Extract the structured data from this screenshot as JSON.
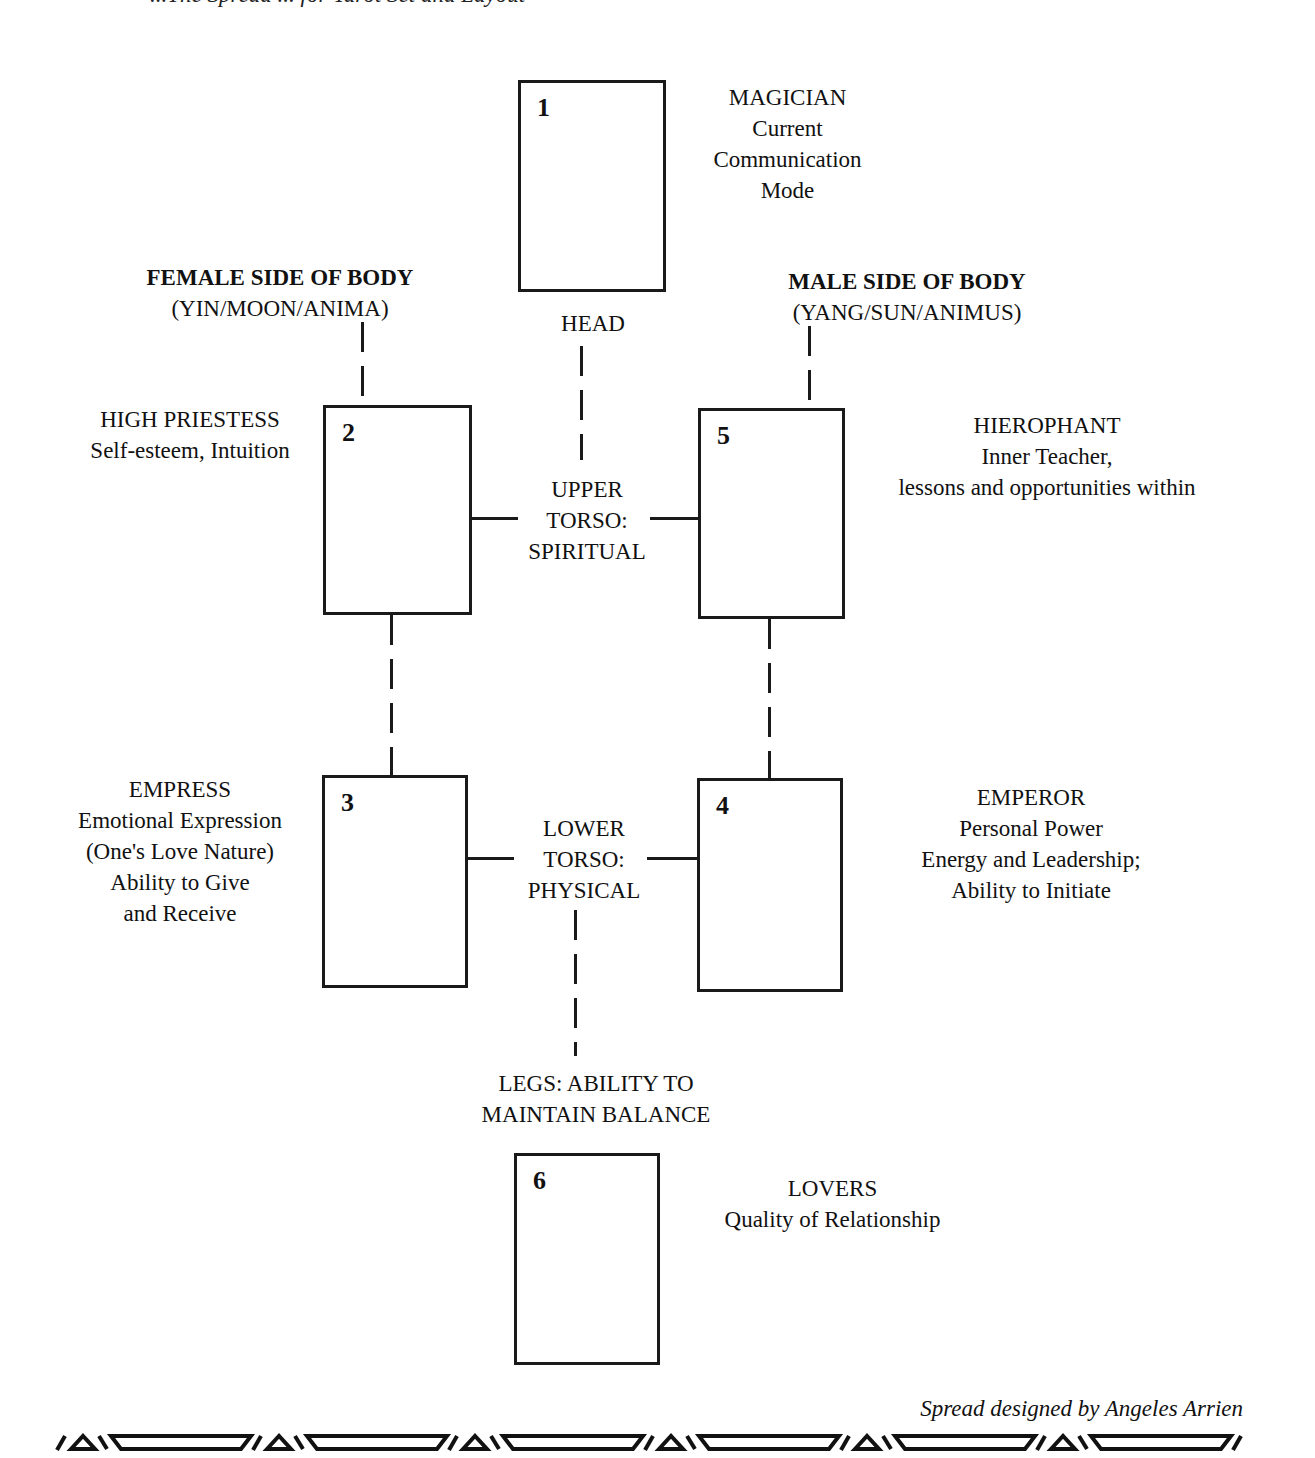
{
  "header": {
    "cut_off_text": "...The Spread ... for Tarot Set and Layout"
  },
  "cards": [
    {
      "number": "1",
      "title": "MAGICIAN",
      "lines": [
        "Current",
        "Communication",
        "Mode"
      ]
    },
    {
      "number": "2",
      "title": "HIGH PRIESTESS",
      "lines": [
        "Self-esteem, Intuition"
      ]
    },
    {
      "number": "3",
      "title": "EMPRESS",
      "lines": [
        "Emotional Expression",
        "(One's Love Nature)",
        "Ability to Give",
        "and Receive"
      ]
    },
    {
      "number": "4",
      "title": "EMPEROR",
      "lines": [
        "Personal Power",
        "Energy and Leadership;",
        "Ability to Initiate"
      ]
    },
    {
      "number": "5",
      "title": "HIEROPHANT",
      "lines": [
        "Inner Teacher,",
        "lessons and opportunities within"
      ]
    },
    {
      "number": "6",
      "title": "LOVERS",
      "lines": [
        "Quality of Relationship"
      ]
    }
  ],
  "sides": {
    "female": {
      "title": "FEMALE SIDE OF BODY",
      "subtitle": "(YIN/MOON/ANIMA)"
    },
    "male": {
      "title": "MALE SIDE OF BODY",
      "subtitle": "(YANG/SUN/ANIMUS)"
    }
  },
  "body_regions": {
    "head": "HEAD",
    "upper_torso": [
      "UPPER",
      "TORSO:",
      "SPIRITUAL"
    ],
    "lower_torso": [
      "LOWER",
      "TORSO:",
      "PHYSICAL"
    ],
    "legs": [
      "LEGS:  ABILITY TO",
      "MAINTAIN BALANCE"
    ]
  },
  "credit": "Spread designed by Angeles Arrien",
  "decoration": {
    "name": "tribal-border-pattern",
    "repeats": 6
  }
}
